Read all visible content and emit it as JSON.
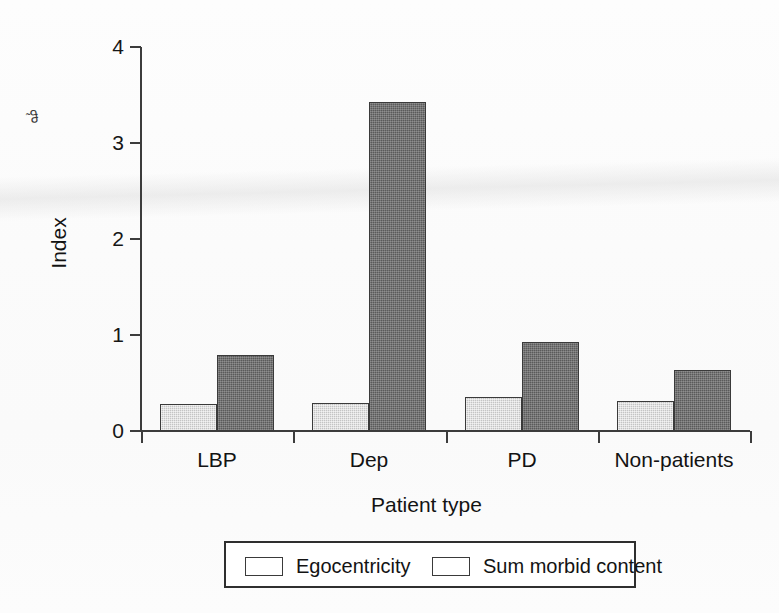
{
  "figure": {
    "artifact_mark": "˜ჵ",
    "background_color": "#ffffff"
  },
  "chart_data": {
    "type": "bar",
    "title": "",
    "xlabel": "Patient type",
    "ylabel": "Index",
    "categories": [
      "LBP",
      "Dep",
      "PD",
      "Non-patients"
    ],
    "series": [
      {
        "name": "Egocentricity",
        "color": "#c4c4c4",
        "values": [
          0.28,
          0.29,
          0.35,
          0.31
        ]
      },
      {
        "name": "Sum morbid content",
        "color": "#5a5a5a",
        "values": [
          0.79,
          3.43,
          0.93,
          0.64
        ]
      }
    ],
    "ylim": [
      0,
      4
    ],
    "yticks": [
      0,
      1,
      2,
      3,
      4
    ],
    "ytick_labels": [
      "0",
      "1",
      "2",
      "3",
      "4"
    ],
    "grid": false,
    "legend_position": "bottom",
    "legend_entries": [
      "Egocentricity",
      "Sum morbid content"
    ]
  }
}
